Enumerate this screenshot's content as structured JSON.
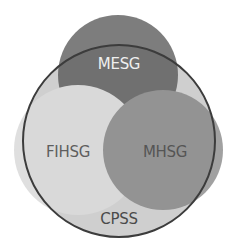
{
  "diagram": {
    "type": "venn",
    "outer_set": {
      "label": "CPSS",
      "fill": "#cfcfcf",
      "stroke": "#3c3c3c",
      "label_color": "#4a4a4a"
    },
    "sets": [
      {
        "id": "mesg",
        "label": "MESG",
        "fill": "#707070",
        "label_color": "#efefef"
      },
      {
        "id": "fihsg",
        "label": "FIHSG",
        "fill": "#d9d9d9",
        "label_color": "#5e5e5e"
      },
      {
        "id": "mhsg",
        "label": "MHSG",
        "fill": "#939393",
        "label_color": "#555555"
      }
    ]
  }
}
